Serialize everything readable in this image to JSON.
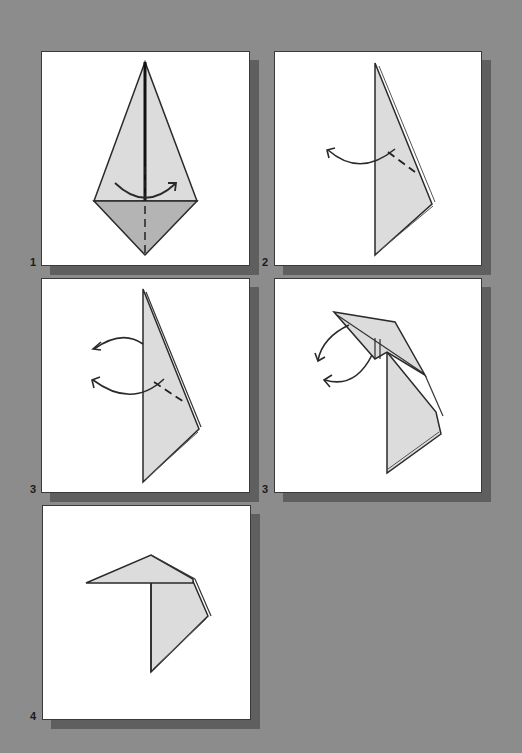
{
  "diagram": {
    "colors": {
      "background": "#8c8c8c",
      "panel": "#ffffff",
      "shadow": "#5f5f5f",
      "paper_light": "#dcdcdc",
      "paper_dark": "#b4b4b4",
      "line": "#2a2a2a"
    },
    "panels": [
      {
        "step": "1",
        "description": "Kite base; valley fold bottom flap along center, arrow turning over to the right"
      },
      {
        "step": "2",
        "description": "Folded in half; inside reverse fold marked with dashed line, arrow curving to the left"
      },
      {
        "step": "3",
        "description": "Two curved arrows indicating reverse folds of top section to the left"
      },
      {
        "step": "3",
        "description": "Top section partially folded down to the left, two curved arrows"
      },
      {
        "step": "4",
        "description": "Completed fold: head section horizontal, body hanging down"
      }
    ]
  }
}
